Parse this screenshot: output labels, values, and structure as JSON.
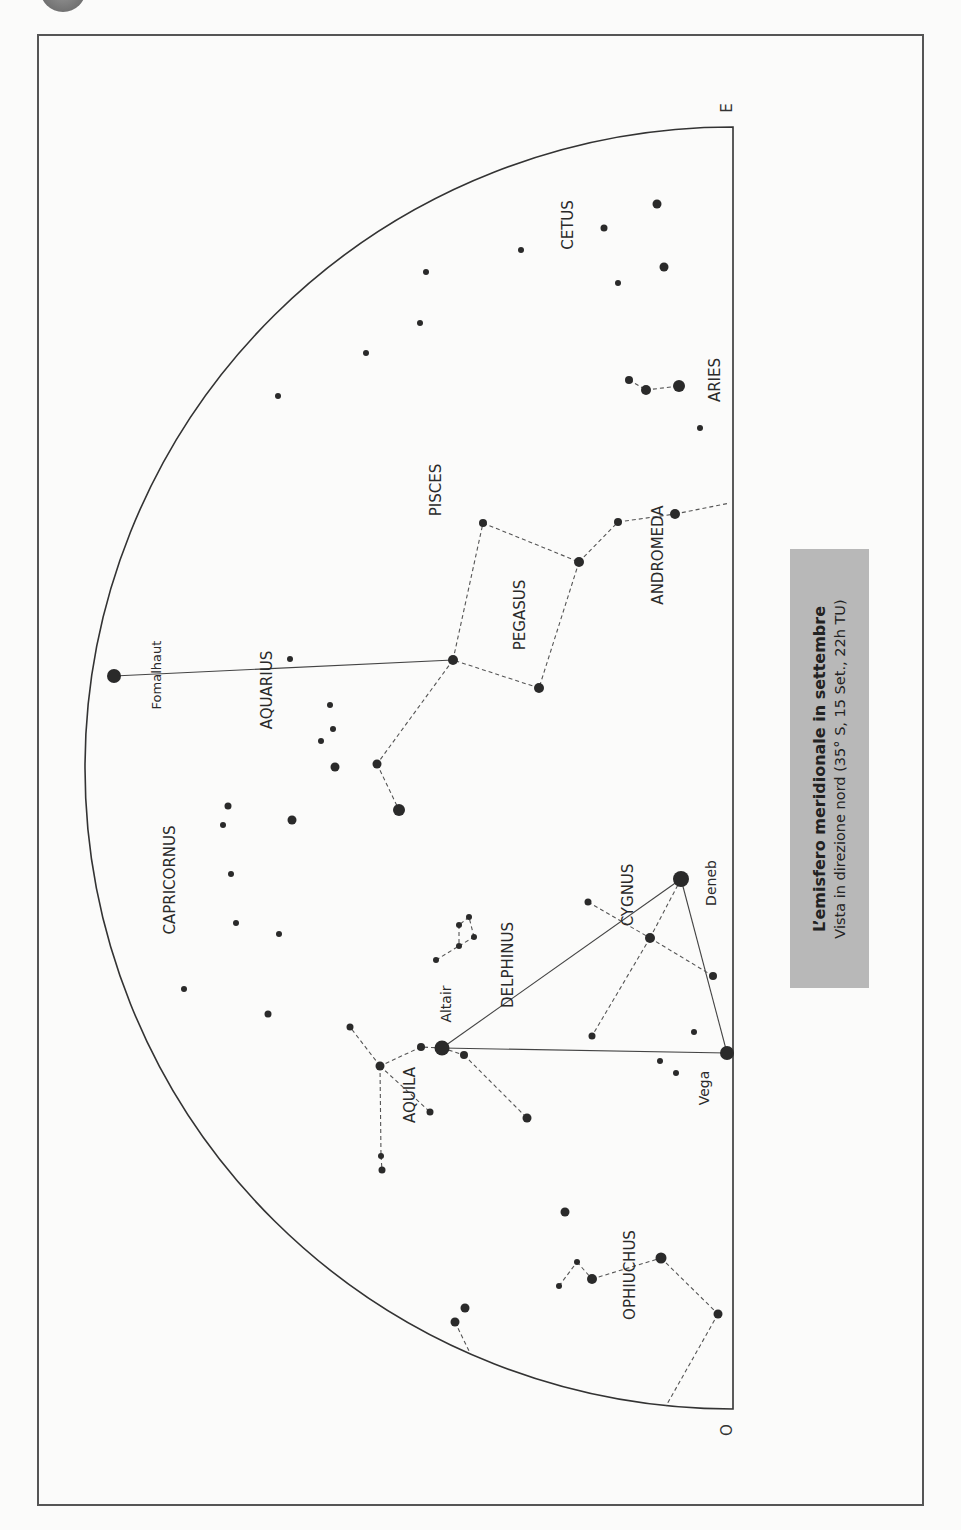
{
  "title": "L’emisfero meridionale in settembre",
  "subtitle": "Vista in direzione nord (35° S, 15 Set., 22h TU)",
  "colors": {
    "ink": "#2a2a2a",
    "legend_bg": "#b8b8b8",
    "paper": "#fbfbfa"
  },
  "directions": [
    {
      "label": "E",
      "x": 727,
      "y": 108
    },
    {
      "label": "O",
      "x": 727,
      "y": 1430
    }
  ],
  "horizon": {
    "cx": 733,
    "cy": 768,
    "rx": 648,
    "ry": 641
  },
  "constellation_labels": [
    {
      "text": "CETUS",
      "x": 568,
      "y": 225
    },
    {
      "text": "ARIES",
      "x": 715,
      "y": 380
    },
    {
      "text": "PISCES",
      "x": 436,
      "y": 490
    },
    {
      "text": "ANDROMEDA",
      "x": 658,
      "y": 555
    },
    {
      "text": "PEGASUS",
      "x": 520,
      "y": 615
    },
    {
      "text": "AQUARIUS",
      "x": 267,
      "y": 690
    },
    {
      "text": "CAPRICORNUS",
      "x": 170,
      "y": 880
    },
    {
      "text": "CYGNUS",
      "x": 628,
      "y": 895
    },
    {
      "text": "DELPHINUS",
      "x": 508,
      "y": 965
    },
    {
      "text": "AQUILA",
      "x": 410,
      "y": 1095
    },
    {
      "text": "OPHIUCHUS",
      "x": 630,
      "y": 1275
    }
  ],
  "star_labels": [
    {
      "text": "Fomalhaut",
      "x": 157,
      "y": 675,
      "size": 13
    },
    {
      "text": "Deneb",
      "x": 712,
      "y": 883,
      "size": 14
    },
    {
      "text": "Altair",
      "x": 447,
      "y": 1004,
      "size": 14
    },
    {
      "text": "Vega",
      "x": 705,
      "y": 1088,
      "size": 14
    }
  ],
  "stars": [
    {
      "x": 114,
      "y": 676,
      "r": 7
    },
    {
      "x": 657,
      "y": 204,
      "r": 4.5
    },
    {
      "x": 604,
      "y": 228,
      "r": 3.5
    },
    {
      "x": 521,
      "y": 250,
      "r": 3
    },
    {
      "x": 664,
      "y": 267,
      "r": 4.5
    },
    {
      "x": 618,
      "y": 283,
      "r": 3
    },
    {
      "x": 426,
      "y": 272,
      "r": 3
    },
    {
      "x": 420,
      "y": 323,
      "r": 3
    },
    {
      "x": 366,
      "y": 353,
      "r": 3
    },
    {
      "x": 278,
      "y": 396,
      "r": 3
    },
    {
      "x": 629,
      "y": 380,
      "r": 4
    },
    {
      "x": 646,
      "y": 390,
      "r": 5
    },
    {
      "x": 679,
      "y": 386,
      "r": 6
    },
    {
      "x": 700,
      "y": 428,
      "r": 3
    },
    {
      "x": 483,
      "y": 523,
      "r": 4
    },
    {
      "x": 579,
      "y": 562,
      "r": 5
    },
    {
      "x": 618,
      "y": 522,
      "r": 4
    },
    {
      "x": 675,
      "y": 514,
      "r": 5
    },
    {
      "x": 453,
      "y": 660,
      "r": 5
    },
    {
      "x": 539,
      "y": 688,
      "r": 5
    },
    {
      "x": 290,
      "y": 659,
      "r": 3
    },
    {
      "x": 330,
      "y": 705,
      "r": 3
    },
    {
      "x": 333,
      "y": 729,
      "r": 3
    },
    {
      "x": 321,
      "y": 741,
      "r": 3
    },
    {
      "x": 335,
      "y": 767,
      "r": 4.5
    },
    {
      "x": 377,
      "y": 764,
      "r": 4.5
    },
    {
      "x": 399,
      "y": 810,
      "r": 6
    },
    {
      "x": 228,
      "y": 806,
      "r": 3.5
    },
    {
      "x": 223,
      "y": 825,
      "r": 3
    },
    {
      "x": 292,
      "y": 820,
      "r": 4.5
    },
    {
      "x": 231,
      "y": 874,
      "r": 3
    },
    {
      "x": 236,
      "y": 923,
      "r": 3
    },
    {
      "x": 279,
      "y": 934,
      "r": 3
    },
    {
      "x": 184,
      "y": 989,
      "r": 3
    },
    {
      "x": 268,
      "y": 1014,
      "r": 3.5
    },
    {
      "x": 681,
      "y": 879,
      "r": 8
    },
    {
      "x": 588,
      "y": 902,
      "r": 3.5
    },
    {
      "x": 650,
      "y": 938,
      "r": 5
    },
    {
      "x": 713,
      "y": 976,
      "r": 4
    },
    {
      "x": 592,
      "y": 1036,
      "r": 3.5
    },
    {
      "x": 694,
      "y": 1032,
      "r": 3
    },
    {
      "x": 660,
      "y": 1061,
      "r": 3
    },
    {
      "x": 676,
      "y": 1073,
      "r": 3
    },
    {
      "x": 727,
      "y": 1053,
      "r": 7
    },
    {
      "x": 469,
      "y": 917,
      "r": 3
    },
    {
      "x": 459,
      "y": 925,
      "r": 3
    },
    {
      "x": 474,
      "y": 937,
      "r": 3
    },
    {
      "x": 459,
      "y": 946,
      "r": 3
    },
    {
      "x": 436,
      "y": 960,
      "r": 3
    },
    {
      "x": 442,
      "y": 1048,
      "r": 7.5
    },
    {
      "x": 421,
      "y": 1047,
      "r": 4
    },
    {
      "x": 464,
      "y": 1055,
      "r": 4
    },
    {
      "x": 350,
      "y": 1027,
      "r": 3.5
    },
    {
      "x": 380,
      "y": 1066,
      "r": 4.5
    },
    {
      "x": 430,
      "y": 1112,
      "r": 3.5
    },
    {
      "x": 527,
      "y": 1118,
      "r": 4.5
    },
    {
      "x": 381,
      "y": 1156,
      "r": 3
    },
    {
      "x": 382,
      "y": 1170,
      "r": 3.5
    },
    {
      "x": 565,
      "y": 1212,
      "r": 4.5
    },
    {
      "x": 661,
      "y": 1258,
      "r": 5.5
    },
    {
      "x": 577,
      "y": 1262,
      "r": 3
    },
    {
      "x": 592,
      "y": 1279,
      "r": 5
    },
    {
      "x": 559,
      "y": 1286,
      "r": 3
    },
    {
      "x": 718,
      "y": 1314,
      "r": 4.5
    },
    {
      "x": 465,
      "y": 1308,
      "r": 4.5
    },
    {
      "x": 455,
      "y": 1322,
      "r": 4.5
    }
  ],
  "solid_lines": [
    [
      [
        114,
        676
      ],
      [
        453,
        660
      ]
    ],
    [
      [
        442,
        1048
      ],
      [
        681,
        879
      ]
    ],
    [
      [
        442,
        1048
      ],
      [
        727,
        1053
      ]
    ],
    [
      [
        681,
        879
      ],
      [
        727,
        1053
      ]
    ]
  ],
  "dashed_lines": [
    [
      [
        646,
        390
      ],
      [
        679,
        386
      ]
    ],
    [
      [
        629,
        380
      ],
      [
        646,
        390
      ]
    ],
    [
      [
        453,
        660
      ],
      [
        483,
        523
      ]
    ],
    [
      [
        483,
        523
      ],
      [
        579,
        562
      ]
    ],
    [
      [
        579,
        562
      ],
      [
        539,
        688
      ]
    ],
    [
      [
        539,
        688
      ],
      [
        453,
        660
      ]
    ],
    [
      [
        579,
        562
      ],
      [
        618,
        522
      ]
    ],
    [
      [
        618,
        522
      ],
      [
        675,
        514
      ]
    ],
    [
      [
        675,
        514
      ],
      [
        730,
        503
      ]
    ],
    [
      [
        453,
        660
      ],
      [
        377,
        764
      ]
    ],
    [
      [
        377,
        764
      ],
      [
        399,
        810
      ]
    ],
    [
      [
        588,
        902
      ],
      [
        650,
        938
      ]
    ],
    [
      [
        650,
        938
      ],
      [
        713,
        976
      ]
    ],
    [
      [
        681,
        879
      ],
      [
        650,
        938
      ]
    ],
    [
      [
        650,
        938
      ],
      [
        592,
        1036
      ]
    ],
    [
      [
        436,
        960
      ],
      [
        459,
        946
      ]
    ],
    [
      [
        459,
        946
      ],
      [
        474,
        937
      ]
    ],
    [
      [
        474,
        937
      ],
      [
        469,
        917
      ]
    ],
    [
      [
        469,
        917
      ],
      [
        459,
        925
      ]
    ],
    [
      [
        459,
        925
      ],
      [
        459,
        946
      ]
    ],
    [
      [
        442,
        1048
      ],
      [
        421,
        1047
      ]
    ],
    [
      [
        421,
        1047
      ],
      [
        380,
        1066
      ]
    ],
    [
      [
        380,
        1066
      ],
      [
        350,
        1027
      ]
    ],
    [
      [
        380,
        1066
      ],
      [
        430,
        1112
      ]
    ],
    [
      [
        380,
        1066
      ],
      [
        381,
        1156
      ]
    ],
    [
      [
        381,
        1156
      ],
      [
        382,
        1170
      ]
    ],
    [
      [
        442,
        1048
      ],
      [
        464,
        1055
      ]
    ],
    [
      [
        464,
        1055
      ],
      [
        527,
        1118
      ]
    ],
    [
      [
        559,
        1286
      ],
      [
        577,
        1262
      ]
    ],
    [
      [
        577,
        1262
      ],
      [
        592,
        1279
      ]
    ],
    [
      [
        592,
        1279
      ],
      [
        661,
        1258
      ]
    ],
    [
      [
        661,
        1258
      ],
      [
        718,
        1314
      ]
    ],
    [
      [
        718,
        1314
      ],
      [
        666,
        1406
      ]
    ],
    [
      [
        455,
        1322
      ],
      [
        470,
        1353
      ]
    ]
  ]
}
